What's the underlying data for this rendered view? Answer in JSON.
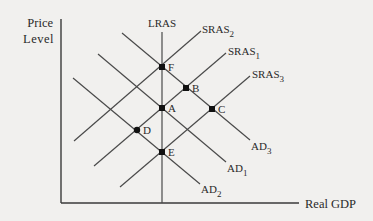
{
  "diagram": {
    "type": "AD-AS model",
    "y_axis": {
      "label_line1": "Price",
      "label_line2": "Level",
      "x": 61,
      "y_top": 19,
      "y_bottom": 203
    },
    "x_axis": {
      "label": "Real GDP",
      "y": 203,
      "x_left": 61,
      "x_right": 299
    },
    "lras": {
      "label": "LRAS",
      "x": 162,
      "y_top": 32,
      "y_bottom": 203
    },
    "sras": [
      {
        "name": "SRAS",
        "sub": "2",
        "x1": 74,
        "y1": 141,
        "x2": 201,
        "y2": 31,
        "label_x": 202,
        "label_y": 33
      },
      {
        "name": "SRAS",
        "sub": "1",
        "x1": 94,
        "y1": 166,
        "x2": 226,
        "y2": 53,
        "label_x": 228,
        "label_y": 55
      },
      {
        "name": "SRAS",
        "sub": "3",
        "x1": 120,
        "y1": 187,
        "x2": 250,
        "y2": 76,
        "label_x": 252,
        "label_y": 78
      }
    ],
    "ad": [
      {
        "name": "AD",
        "sub": "3",
        "x1": 122,
        "y1": 33,
        "x2": 250,
        "y2": 140,
        "label_x": 251,
        "label_y": 150
      },
      {
        "name": "AD",
        "sub": "1",
        "x1": 98,
        "y1": 54,
        "x2": 226,
        "y2": 162,
        "label_x": 227,
        "label_y": 172
      },
      {
        "name": "AD",
        "sub": "2",
        "x1": 73,
        "y1": 78,
        "x2": 200,
        "y2": 184,
        "label_x": 201,
        "label_y": 193
      }
    ],
    "points": [
      {
        "label": "F",
        "x": 162,
        "y": 67,
        "shape": "square"
      },
      {
        "label": "B",
        "x": 186,
        "y": 88,
        "shape": "square"
      },
      {
        "label": "A",
        "x": 162,
        "y": 108,
        "shape": "square"
      },
      {
        "label": "C",
        "x": 212,
        "y": 109,
        "shape": "square"
      },
      {
        "label": "D",
        "x": 137,
        "y": 130,
        "shape": "circle"
      },
      {
        "label": "E",
        "x": 162,
        "y": 152,
        "shape": "square"
      }
    ]
  }
}
